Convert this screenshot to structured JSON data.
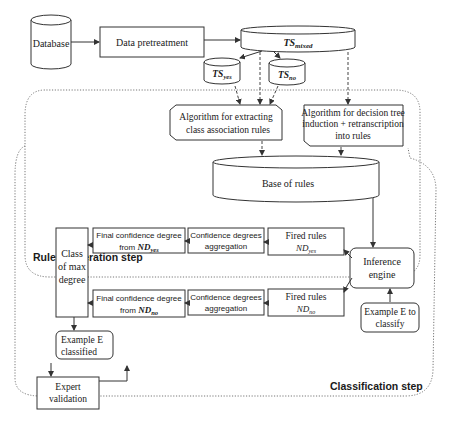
{
  "nodes": {
    "database": {
      "label": "Database"
    },
    "data_pretreatment": {
      "label": "Data pretreatment"
    },
    "ts_mixed": {
      "label_main": "TS",
      "label_sub": "mixed"
    },
    "ts_yes": {
      "label_main": "TS",
      "label_sub": "yes"
    },
    "ts_no": {
      "label_main": "TS",
      "label_sub": "no"
    },
    "algo_class_assoc": {
      "line1": "Algorithm for extracting",
      "line2": "class association rules"
    },
    "algo_decision_tree": {
      "line1": "Algorithm for decision tree",
      "line2": "induction + retranscription",
      "line3": "into rules"
    },
    "base_of_rules": {
      "label": "Base of rules"
    },
    "inference_engine": {
      "line1": "Inference",
      "line2": "engine"
    },
    "example_to_classify": {
      "line1": "Example E to",
      "line2": "classify"
    },
    "fired_rules_yes": {
      "line1": "Fired rules",
      "line2_main": "ND",
      "line2_sub": "yes"
    },
    "fired_rules_no": {
      "line1": "Fired rules",
      "line2_main": "ND",
      "line2_sub": "no"
    },
    "aggregation_yes": {
      "line1": "Confidence degrees",
      "line2": "aggregation"
    },
    "aggregation_no": {
      "line1": "Confidence degrees",
      "line2": "aggregation"
    },
    "final_conf_yes": {
      "line1": "Final confidence degree",
      "line2_prefix": "from ",
      "line2_main": "ND",
      "line2_sub": "yes"
    },
    "final_conf_no": {
      "line1": "Final confidence degree",
      "line2_prefix": "from ",
      "line2_main": "ND",
      "line2_sub": "no"
    },
    "class_max_degree": {
      "line1": "Class",
      "line2": "of max",
      "line3": "degree"
    },
    "example_classified": {
      "line1": "Example E",
      "line2": "classified"
    },
    "expert_validation": {
      "line1": "Expert",
      "line2": "validation"
    }
  },
  "regions": {
    "rules_generation": {
      "label": "Rules generation step"
    },
    "classification": {
      "label": "Classification step"
    }
  }
}
